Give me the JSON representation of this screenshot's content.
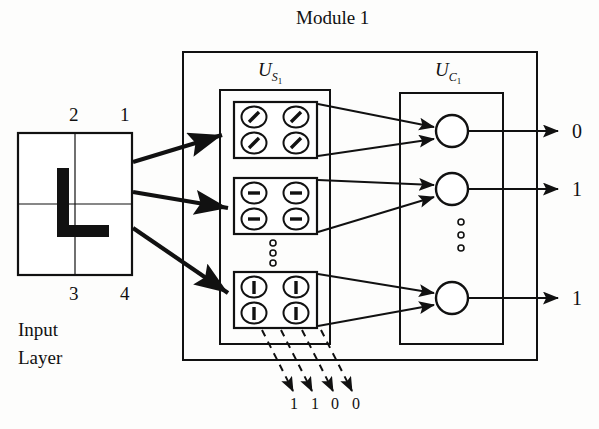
{
  "diagram": {
    "title": "Module 1",
    "input_layer": {
      "caption_line1": "Input",
      "caption_line2": "Layer",
      "quadrant_labels": {
        "top_right": "1",
        "top_left": "2",
        "bottom_left": "3",
        "bottom_right": "4"
      },
      "pattern": "L-shape stroke"
    },
    "us_layer": {
      "label_main": "U",
      "label_sub": "S",
      "label_subsub": "1",
      "planes": [
        {
          "name": "diagonal-plane",
          "feature": "diagonal-line",
          "cells": 4
        },
        {
          "name": "horizontal-plane",
          "feature": "horizontal-line",
          "cells": 4
        },
        {
          "name": "vertical-plane",
          "feature": "vertical-line",
          "cells": 4
        }
      ],
      "ellipsis": "vertical-dots"
    },
    "uc_layer": {
      "label_main": "U",
      "label_sub": "C",
      "label_subsub": "1",
      "nodes": [
        {
          "name": "uc-node-1",
          "output": "0"
        },
        {
          "name": "uc-node-2",
          "output": "1"
        },
        {
          "name": "uc-node-3",
          "output": "1"
        }
      ],
      "ellipsis": "vertical-dots"
    },
    "outputs": [
      "0",
      "1",
      "1"
    ],
    "dashed_readout": {
      "values": [
        "1",
        "1",
        "0",
        "0"
      ],
      "arrow_style": "dashed"
    },
    "colors": {
      "ink": "#111111",
      "background": "#fdfdfc"
    }
  }
}
